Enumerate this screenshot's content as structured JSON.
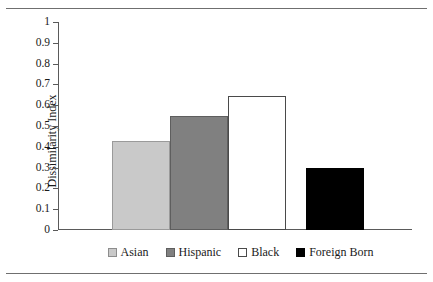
{
  "chart_data": {
    "type": "bar",
    "title": "",
    "xlabel": "",
    "ylabel": "Dissimilarity Index",
    "categories": [
      "Asian",
      "Hispanic",
      "Black",
      "Foreign Born"
    ],
    "values": [
      0.43,
      0.55,
      0.645,
      0.3
    ],
    "ylim": [
      0,
      1
    ],
    "ytick_labels": [
      "1",
      "0.9",
      "0.8",
      "0.7",
      "0.6",
      "0.5",
      "0.4",
      "0.3",
      "0.2",
      "0.1",
      "0"
    ],
    "ytick_values": [
      1,
      0.9,
      0.8,
      0.7,
      0.6,
      0.5,
      0.4,
      0.3,
      0.2,
      0.1,
      0
    ],
    "grid": false,
    "legend_position": "bottom",
    "series": [
      {
        "name": "Asian",
        "value": 0.43,
        "color": "#c9c9c9"
      },
      {
        "name": "Hispanic",
        "value": 0.55,
        "color": "#808080"
      },
      {
        "name": "Black",
        "value": 0.645,
        "color": "#ffffff"
      },
      {
        "name": "Foreign Born",
        "value": 0.3,
        "color": "#000000"
      }
    ]
  },
  "legend": {
    "items": [
      {
        "label": "Asian",
        "key": "asian"
      },
      {
        "label": "Hispanic",
        "key": "hispanic"
      },
      {
        "label": "Black",
        "key": "black"
      },
      {
        "label": "Foreign Born",
        "key": "foreign"
      }
    ]
  }
}
